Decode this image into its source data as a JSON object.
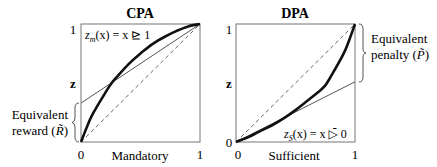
{
  "chart_data": [
    {
      "type": "line",
      "title": "CPA",
      "xlabel": "Mandatory",
      "ylabel": "z",
      "xlim": [
        0,
        1
      ],
      "ylim": [
        0,
        1
      ],
      "x_ticks": [
        "0",
        "1"
      ],
      "y_ticks": [
        "1"
      ],
      "formula": {
        "lhs": "z",
        "sub": "m",
        "arg": "(x) = x ",
        "op": "⊵",
        "rhs": " 1"
      },
      "annotation": {
        "line1": "Equivalent",
        "line2": "reward (",
        "sym": "R̃",
        "close": ")",
        "range": [
          0,
          0.33
        ]
      },
      "series": [
        {
          "name": "thick-curve",
          "style": "thick",
          "shape": "concave",
          "x": [
            0,
            0.05,
            0.1,
            0.2,
            0.25,
            0.3,
            0.4,
            0.5,
            0.6,
            0.7,
            0.8,
            0.9,
            1.0
          ],
          "y": [
            0,
            0.13,
            0.24,
            0.41,
            0.49,
            0.55,
            0.66,
            0.75,
            0.83,
            0.89,
            0.94,
            0.98,
            1.0
          ]
        },
        {
          "name": "thin-line",
          "style": "thin",
          "x": [
            0,
            1
          ],
          "y": [
            0.33,
            1
          ]
        },
        {
          "name": "diagonal",
          "style": "dashed",
          "x": [
            0,
            1
          ],
          "y": [
            0,
            1
          ]
        }
      ]
    },
    {
      "type": "line",
      "title": "DPA",
      "xlabel": "Sufficient",
      "ylabel": "z",
      "xlim": [
        0,
        1
      ],
      "ylim": [
        0,
        1
      ],
      "x_ticks": [
        "0",
        "1"
      ],
      "y_ticks": [
        "0",
        "1"
      ],
      "formula": {
        "lhs": "z",
        "sub": "S",
        "arg": "(x) = x ",
        "op": "▷̄",
        "rhs": " 0"
      },
      "annotation": {
        "line1": "Equivalent",
        "line2": "penalty (",
        "sym": "P̃",
        "close": ")",
        "range": [
          0.51,
          1
        ]
      },
      "series": [
        {
          "name": "thick-curve",
          "style": "thick",
          "shape": "convex",
          "x": [
            0,
            0.1,
            0.2,
            0.3,
            0.4,
            0.5,
            0.6,
            0.7,
            0.75,
            0.8,
            0.9,
            0.95,
            1.0
          ],
          "y": [
            0,
            0.04,
            0.09,
            0.14,
            0.2,
            0.27,
            0.35,
            0.43,
            0.48,
            0.56,
            0.74,
            0.86,
            1.0
          ]
        },
        {
          "name": "thin-line",
          "style": "thin",
          "x": [
            0,
            1
          ],
          "y": [
            0,
            0.51
          ]
        },
        {
          "name": "diagonal",
          "style": "dashed",
          "x": [
            0,
            1
          ],
          "y": [
            0,
            1
          ]
        }
      ]
    }
  ]
}
